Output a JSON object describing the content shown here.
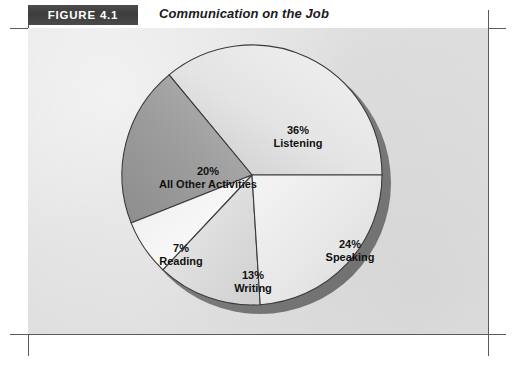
{
  "figure": {
    "number": "FIGURE 4.1",
    "title": "Communication on the Job"
  },
  "colors": {
    "panel_background": "#e2e2e2",
    "figure_number_box": "#3f3f3f",
    "figure_number_text": "#ffffff",
    "title_text": "#1a1a1a",
    "slice_outline": "#333333",
    "pie_shadow": "#7e7e7e",
    "crop_mark": "#5b5b5b",
    "label_text": "#111111"
  },
  "chart_data": {
    "type": "pie",
    "title": "Communication on the Job",
    "subtitle": "",
    "xlabel": "",
    "ylabel": "",
    "legend_position": "none",
    "grid": false,
    "units": "percent",
    "total": 100,
    "start_angle_deg": 0,
    "direction": "clockwise",
    "categories": [
      "Listening",
      "Speaking",
      "Writing",
      "Reading",
      "All Other Activities"
    ],
    "values": [
      36,
      24,
      13,
      7,
      20
    ],
    "slices": [
      {
        "name": "Listening",
        "value": 36,
        "percent_label": "36%",
        "fill": "#e9e9e9"
      },
      {
        "name": "Speaking",
        "value": 24,
        "percent_label": "24%",
        "fill": "#ededed"
      },
      {
        "name": "Writing",
        "value": 13,
        "percent_label": "13%",
        "fill": "#dcdcdc"
      },
      {
        "name": "Reading",
        "value": 7,
        "percent_label": "7%",
        "fill": "#f6f6f6"
      },
      {
        "name": "All Other Activities",
        "value": 20,
        "percent_label": "20%",
        "fill": "#9d9d9d"
      }
    ],
    "labels": {
      "listening": {
        "percent": "36%",
        "name": "Listening"
      },
      "speaking": {
        "percent": "24%",
        "name": "Speaking"
      },
      "writing": {
        "percent": "13%",
        "name": "Writing"
      },
      "reading": {
        "percent": "7%",
        "name": "Reading"
      },
      "all_other": {
        "percent": "20%",
        "name": "All Other Activities"
      }
    }
  }
}
